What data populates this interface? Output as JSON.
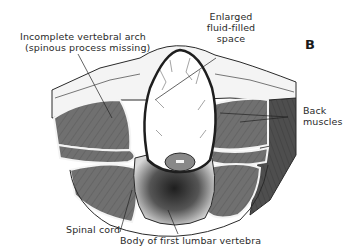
{
  "figure": {
    "panel_letter": "B",
    "labels": {
      "vertebral_arch_line1": "Incomplete vertebral arch",
      "vertebral_arch_line2": "(spinous process missing)",
      "fluid_line1": "Enlarged",
      "fluid_line2": "fluid-filled",
      "fluid_line3": "space",
      "back_muscles_line1": "Back",
      "back_muscles_line2": "muscles",
      "spinal_cord": "Spinal cord",
      "vertebra_body": "Body of first lumbar vertebra"
    },
    "colors": {
      "muscle": "#6e6e6e",
      "muscle_dark": "#4a4a4a",
      "skin": "#f2f2f2",
      "outline": "#2a2a2a",
      "sac_outline": "#1e1e1e",
      "bone": "#d9d9d9"
    }
  }
}
